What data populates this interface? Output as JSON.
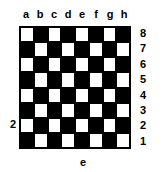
{
  "diagram": {
    "kind": "chessboard",
    "size": 8,
    "colors": {
      "dark_square": "#000000",
      "light_square": "#ffffff",
      "label_text": "#000000",
      "background": "#ffffff"
    },
    "file_labels": [
      "a",
      "b",
      "c",
      "d",
      "e",
      "f",
      "g",
      "h"
    ],
    "rank_labels": [
      "8",
      "7",
      "6",
      "5",
      "4",
      "3",
      "2",
      "1"
    ],
    "callouts": {
      "left_rank": "2",
      "bottom_file": "e"
    },
    "squares": [
      [
        "light",
        "dark",
        "light",
        "dark",
        "light",
        "dark",
        "light",
        "dark"
      ],
      [
        "dark",
        "light",
        "dark",
        "light",
        "dark",
        "light",
        "dark",
        "light"
      ],
      [
        "light",
        "dark",
        "light",
        "dark",
        "light",
        "dark",
        "light",
        "dark"
      ],
      [
        "dark",
        "light",
        "dark",
        "light",
        "dark",
        "light",
        "dark",
        "light"
      ],
      [
        "light",
        "dark",
        "light",
        "dark",
        "light",
        "dark",
        "light",
        "dark"
      ],
      [
        "dark",
        "light",
        "dark",
        "light",
        "dark",
        "light",
        "dark",
        "light"
      ],
      [
        "light",
        "dark",
        "light",
        "dark",
        "light",
        "dark",
        "light",
        "dark"
      ],
      [
        "dark",
        "light",
        "dark",
        "light",
        "dark",
        "light",
        "dark",
        "light"
      ]
    ]
  }
}
